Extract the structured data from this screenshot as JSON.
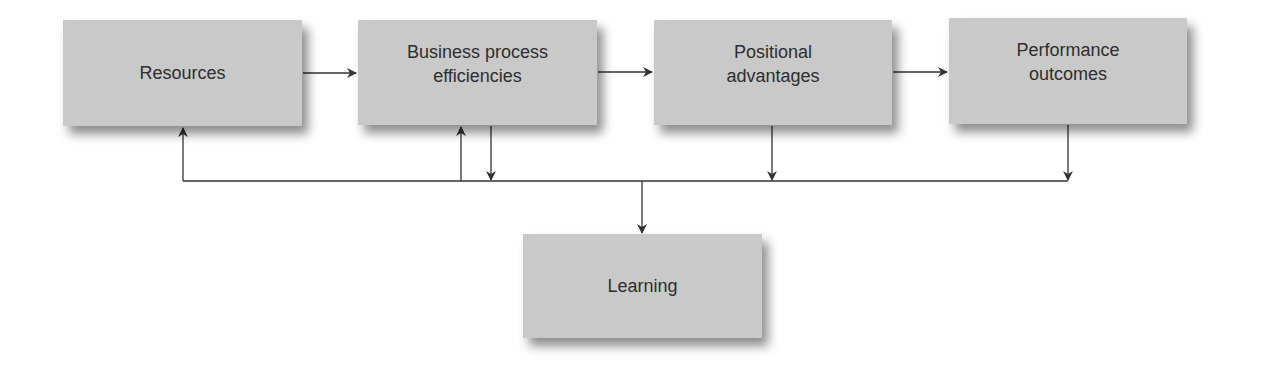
{
  "diagram": {
    "nodes": [
      {
        "id": "resources",
        "label": "Resources"
      },
      {
        "id": "business",
        "label": "Business process\nefficiencies"
      },
      {
        "id": "positional",
        "label": "Positional\nadvantages"
      },
      {
        "id": "performance",
        "label": "Performance\noutcomes"
      },
      {
        "id": "learning",
        "label": "Learning"
      }
    ],
    "edges": [
      {
        "from": "resources",
        "to": "business"
      },
      {
        "from": "business",
        "to": "positional"
      },
      {
        "from": "positional",
        "to": "performance"
      },
      {
        "from": "business",
        "to": "learning"
      },
      {
        "from": "positional",
        "to": "learning"
      },
      {
        "from": "performance",
        "to": "learning"
      },
      {
        "from": "learning",
        "to": "resources"
      },
      {
        "from": "learning",
        "to": "business"
      }
    ],
    "colors": {
      "box_fill": "#c9c9c9",
      "text": "#2e2e2e",
      "line": "#333333"
    }
  }
}
